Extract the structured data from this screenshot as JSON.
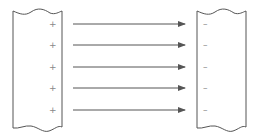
{
  "diagram": {
    "left_plate": {
      "charge_sign": "+",
      "count": 5
    },
    "right_plate": {
      "charge_sign": "–",
      "count": 5
    },
    "arrows": {
      "count": 5,
      "direction": "left-to-right"
    },
    "colors": {
      "line": "#555555",
      "arrow": "#555555",
      "sign": "#888888",
      "background": "#ffffff"
    },
    "rows_y": [
      24,
      45,
      67,
      88,
      110
    ],
    "labels": {
      "plus": [
        "+",
        "+",
        "+",
        "+",
        "+"
      ],
      "minus": [
        "–",
        "–",
        "–",
        "–",
        "–"
      ]
    }
  }
}
